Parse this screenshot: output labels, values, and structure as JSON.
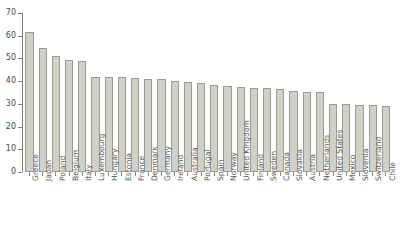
{
  "chart_data": {
    "type": "bar",
    "title": "",
    "xlabel": "",
    "ylabel": "",
    "ylim": [
      0,
      70
    ],
    "yticks": [
      0,
      10,
      20,
      30,
      40,
      50,
      60,
      70
    ],
    "grid": false,
    "legend": false,
    "bar_color": "#cfd0c8",
    "bar_edge_color": "#9a9b93",
    "axis_color": "#7d7d7d",
    "categories": [
      "Greece",
      "Japan",
      "Poland",
      "Belgium",
      "Italy",
      "Luxembourg",
      "Hungary",
      "Estonia",
      "France",
      "Denmark",
      "Germany",
      "Ireland",
      "Australia",
      "Portugal",
      "Spain",
      "Norway",
      "United Kingdom",
      "Finland",
      "Sweden",
      "Canada",
      "Slovakia",
      "Austria",
      "Netherlands",
      "United States",
      "Mexico",
      "Slovenia",
      "Switzerland",
      "Chile"
    ],
    "values": [
      61.5,
      54.5,
      51.0,
      49.3,
      49.0,
      42.0,
      42.0,
      41.8,
      41.2,
      41.0,
      40.8,
      40.0,
      39.5,
      39.2,
      38.5,
      38.0,
      37.5,
      37.2,
      37.0,
      36.5,
      35.5,
      35.3,
      35.2,
      30.0,
      29.8,
      29.6,
      29.4,
      29.0
    ]
  }
}
